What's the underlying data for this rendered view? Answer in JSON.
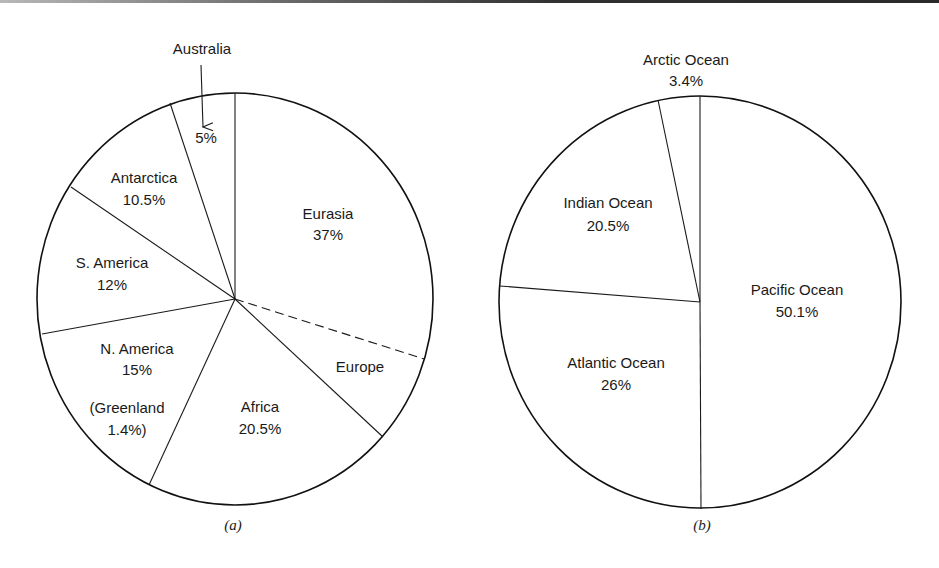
{
  "chart_data": [
    {
      "type": "pie",
      "title": "",
      "caption": "(a)",
      "description": "Share of land area by continent",
      "categories": [
        "Eurasia",
        "Africa",
        "N. America",
        "S. America",
        "Antarctica",
        "Australia"
      ],
      "values": [
        37,
        20.5,
        15,
        12,
        10.5,
        5
      ],
      "labels": [
        {
          "name": "Eurasia",
          "value": "37%"
        },
        {
          "name": "Africa",
          "value": "20.5%"
        },
        {
          "name": "N. America",
          "value": "15%"
        },
        {
          "name": "S. America",
          "value": "12%"
        },
        {
          "name": "Antarctica",
          "value": "10.5%"
        },
        {
          "name": "Australia",
          "value": "5%"
        }
      ],
      "sub_slices": [
        {
          "name": "Europe",
          "within": "Eurasia",
          "style": "dashed boundary"
        }
      ],
      "annotations": [
        {
          "text": "(Greenland",
          "text2": "1.4%)",
          "within": "N. America"
        },
        {
          "text": "Australia",
          "arrow_to": "5%"
        }
      ],
      "start_angle_deg": 0,
      "direction": "clockwise from 12 o'clock"
    },
    {
      "type": "pie",
      "title": "",
      "caption": "(b)",
      "description": "Share of ocean area by ocean",
      "categories": [
        "Pacific Ocean",
        "Atlantic Ocean",
        "Indian Ocean",
        "Arctic Ocean"
      ],
      "values": [
        50.1,
        26,
        20.5,
        3.4
      ],
      "labels": [
        {
          "name": "Pacific Ocean",
          "value": "50.1%"
        },
        {
          "name": "Atlantic Ocean",
          "value": "26%"
        },
        {
          "name": "Indian Ocean",
          "value": "20.5%"
        },
        {
          "name": "Arctic Ocean",
          "value": "3.4%"
        }
      ],
      "start_angle_deg": 0,
      "direction": "clockwise from 12 o'clock"
    }
  ],
  "pie_a": {
    "caption": "(a)",
    "geometry": {
      "cx": 235,
      "cy": 299,
      "rx": 198,
      "ry": 206
    },
    "edges": [
      {
        "name": "eurasia-australia-edge",
        "x2": 235,
        "y2": 93
      },
      {
        "name": "australia-antarctica-edge",
        "x2": 170,
        "y2": 103
      },
      {
        "name": "antarctica-samerica-edge",
        "x2": 71,
        "y2": 187
      },
      {
        "name": "samerica-namerica-edge",
        "x2": 42,
        "y2": 334
      },
      {
        "name": "namerica-africa-edge",
        "x2": 149,
        "y2": 485
      },
      {
        "name": "africa-europe-edge",
        "x2": 383,
        "y2": 437
      }
    ],
    "dashed_edge": {
      "name": "europe-asia-dashed-edge",
      "x2": 424,
      "y2": 359
    },
    "labels": {
      "eurasia": {
        "name": "Eurasia",
        "value": "37%",
        "x": 328,
        "y1": 215,
        "y2": 236
      },
      "europe": {
        "name": "Europe",
        "x": 360,
        "y": 368
      },
      "africa": {
        "name": "Africa",
        "value": "20.5%",
        "x": 260,
        "y1": 408,
        "y2": 430
      },
      "namerica": {
        "name": "N. America",
        "value": "15%",
        "x": 137,
        "y1": 350,
        "y2": 371
      },
      "greenland": {
        "name": "(Greenland",
        "value": "1.4%)",
        "x": 127,
        "y1": 409,
        "y2": 431
      },
      "samerica": {
        "name": "S. America",
        "value": "12%",
        "x": 112,
        "y1": 264,
        "y2": 286
      },
      "antarctica": {
        "name": "Antarctica",
        "value": "10.5%",
        "x": 144,
        "y1": 179,
        "y2": 201
      },
      "australia": {
        "name": "Australia",
        "value": "5%",
        "x": 202,
        "y": 50,
        "value_x": 206,
        "value_y": 139
      },
      "australia_arrow": {
        "x1": 201,
        "y1": 65,
        "x2": 203,
        "y2": 127
      }
    }
  },
  "pie_b": {
    "caption": "(b)",
    "geometry": {
      "cx": 700,
      "cy": 302,
      "rx": 201,
      "ry": 206
    },
    "edges": [
      {
        "name": "pacific-arctic-edge",
        "x2": 700,
        "y2": 96
      },
      {
        "name": "arctic-indian-edge",
        "x2": 658,
        "y2": 100
      },
      {
        "name": "indian-atlantic-edge",
        "x2": 500,
        "y2": 286
      },
      {
        "name": "atlantic-pacific-edge",
        "x2": 701,
        "y2": 509
      }
    ],
    "labels": {
      "pacific": {
        "name": "Pacific Ocean",
        "value": "50.1%",
        "x": 797,
        "y1": 291,
        "y2": 313
      },
      "atlantic": {
        "name": "Atlantic Ocean",
        "value": "26%",
        "x": 616,
        "y1": 364,
        "y2": 386
      },
      "indian": {
        "name": "Indian Ocean",
        "value": "20.5%",
        "x": 608,
        "y1": 204,
        "y2": 227
      },
      "arctic": {
        "name": "Arctic Ocean",
        "value": "3.4%",
        "x": 686,
        "y1": 61,
        "y2": 82
      }
    }
  },
  "captions": {
    "a": "(a)",
    "b": "(b)"
  }
}
